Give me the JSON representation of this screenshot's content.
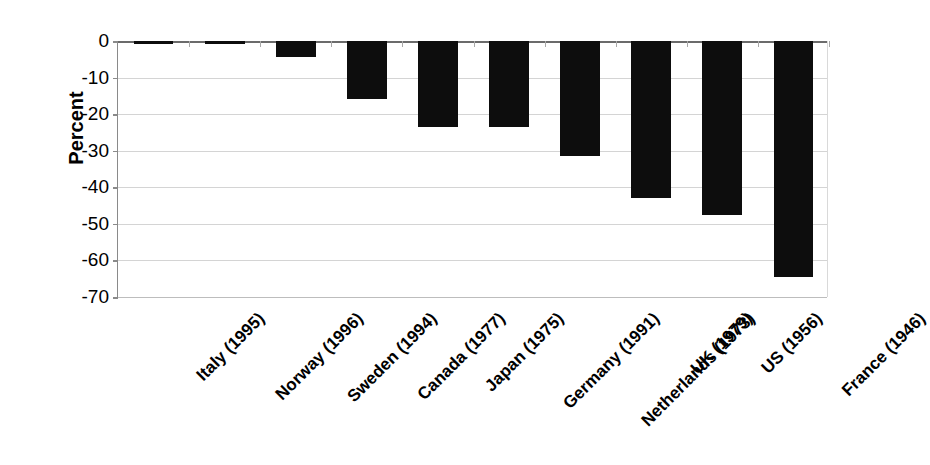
{
  "chart_data": {
    "type": "bar",
    "title": "",
    "subtitle": "",
    "xlabel": "",
    "ylabel": "Percent",
    "ylim": [
      -70,
      0
    ],
    "yticks": [
      0,
      -10,
      -20,
      -30,
      -40,
      -50,
      -60,
      -70
    ],
    "ytick_labels": [
      "0",
      "-10",
      "-20",
      "-30",
      "-40",
      "-50",
      "-60",
      "-70"
    ],
    "grid": true,
    "legend": null,
    "legend_position": "none",
    "orientation": "vertical",
    "bar_color": "#0d0d0d",
    "categories": [
      "Italy (1995)",
      "Norway (1996)",
      "Sweden (1994)",
      "Canada (1977)",
      "Japan (1975)",
      "Germany (1991)",
      "Netherlands (1973)",
      "UK (1979)",
      "US (1956)",
      "France (1946)"
    ],
    "values": [
      -0.3,
      -0.5,
      -4.5,
      -15.8,
      -23.5,
      -23.5,
      -31.5,
      -43.0,
      -47.5,
      -64.5
    ],
    "units": "percent"
  }
}
